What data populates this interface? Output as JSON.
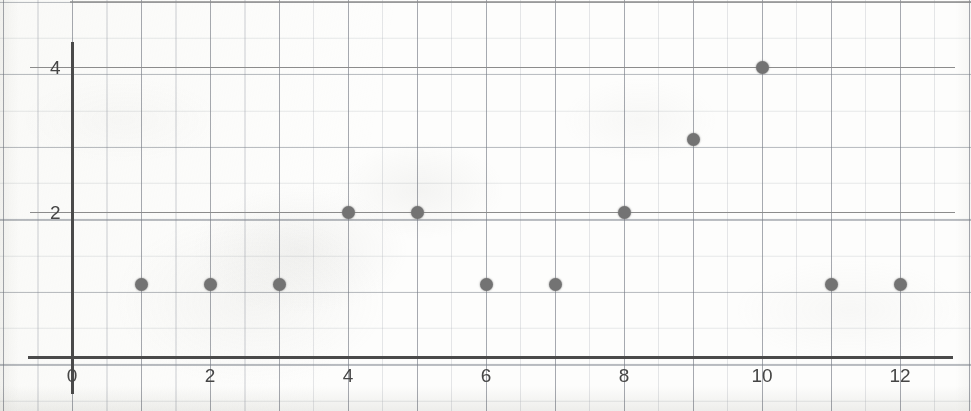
{
  "chart_data": {
    "type": "scatter",
    "title": "",
    "subtitle": "",
    "xlabel": "",
    "ylabel": "",
    "xlim": [
      0,
      12.6
    ],
    "ylim": [
      0,
      4.6
    ],
    "grid": true,
    "legend": null,
    "x_ticks": [
      0,
      2,
      4,
      6,
      8,
      10,
      12
    ],
    "x_tick_labels": [
      "0",
      "2",
      "4",
      "6",
      "8",
      "10",
      "12"
    ],
    "y_ticks": [
      2,
      4
    ],
    "y_tick_labels": [
      "2",
      "4"
    ],
    "x": [
      1,
      2,
      3,
      4,
      5,
      6,
      7,
      8,
      9,
      10,
      11,
      12
    ],
    "y": [
      1,
      1,
      1,
      2,
      2,
      1,
      1,
      2,
      3,
      4,
      1,
      1
    ],
    "points": [
      {
        "x": 1,
        "y": 1
      },
      {
        "x": 2,
        "y": 1
      },
      {
        "x": 3,
        "y": 1
      },
      {
        "x": 4,
        "y": 2
      },
      {
        "x": 5,
        "y": 2
      },
      {
        "x": 6,
        "y": 1
      },
      {
        "x": 7,
        "y": 1
      },
      {
        "x": 8,
        "y": 2
      },
      {
        "x": 9,
        "y": 3
      },
      {
        "x": 10,
        "y": 4
      },
      {
        "x": 11,
        "y": 1
      },
      {
        "x": 12,
        "y": 1
      }
    ],
    "marker": "circle",
    "marker_color": "#737373",
    "axis_color": "#4a4a4a",
    "grid_color": "#8c8c8c",
    "minor_grid_color": "#b9bdc6",
    "background_color": "#fdfdfc",
    "value_gridlines": [
      2,
      4
    ],
    "minor_grid_step_x": 0.5,
    "minor_grid_step_y": 0.5
  },
  "geometry": {
    "origin_x_px": 72,
    "origin_y_px": 357,
    "px_per_x_unit": 69,
    "px_per_y_unit": 72.5
  }
}
